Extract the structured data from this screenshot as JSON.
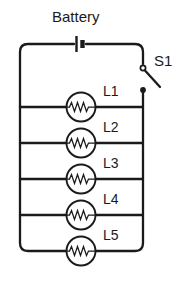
{
  "diagram": {
    "background_color": "#ffffff",
    "line_color": "#1a1a1a",
    "battery": {
      "label": "Battery",
      "symbol": "battery-icon"
    },
    "switch": {
      "label": "S1",
      "symbol": "switch-open-icon",
      "state": "open"
    },
    "lamps": [
      {
        "label": "L1",
        "symbol": "lamp-resistor-icon"
      },
      {
        "label": "L2",
        "symbol": "lamp-resistor-icon"
      },
      {
        "label": "L3",
        "symbol": "lamp-resistor-icon"
      },
      {
        "label": "L4",
        "symbol": "lamp-resistor-icon"
      },
      {
        "label": "L5",
        "symbol": "lamp-resistor-icon"
      }
    ]
  }
}
